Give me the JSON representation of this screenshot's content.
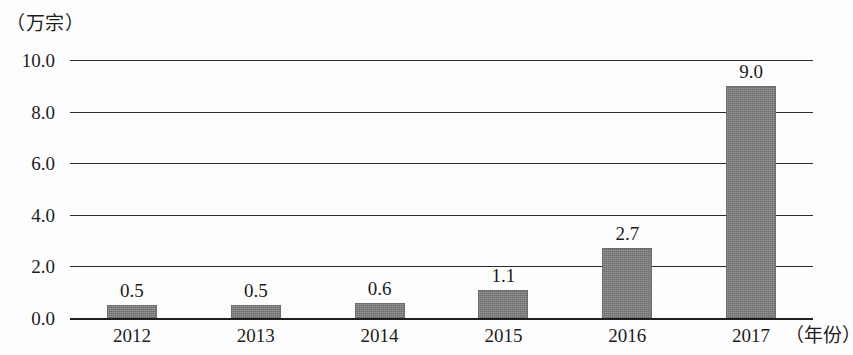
{
  "chart_data": {
    "type": "bar",
    "title": "",
    "subtitle": "",
    "xlabel": "（年份）",
    "ylabel": "（万宗）",
    "categories": [
      "2012",
      "2013",
      "2014",
      "2015",
      "2016",
      "2017"
    ],
    "values": [
      0.5,
      0.5,
      0.6,
      1.1,
      2.7,
      9.0
    ],
    "value_labels": [
      "0.5",
      "0.5",
      "0.6",
      "1.1",
      "2.7",
      "9.0"
    ],
    "ylim": [
      0.0,
      10.0
    ],
    "ytick_labels": [
      "0.0",
      "2.0",
      "4.0",
      "6.0",
      "8.0",
      "10.0"
    ],
    "ytick_values": [
      0.0,
      2.0,
      4.0,
      6.0,
      8.0,
      10.0
    ],
    "grid": true,
    "legend": false,
    "legend_position": "none",
    "bar_color": "#7d7d7d",
    "axis_color": "#2b2b2b",
    "background_color": "#fdfdfd"
  }
}
